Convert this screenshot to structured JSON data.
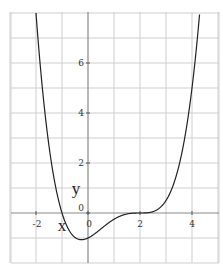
{
  "chart_data": {
    "type": "line",
    "title": "",
    "xlabel": "x",
    "ylabel": "y",
    "function": "y = (x + 1)(x - 2)^3 / 8",
    "xlim": [
      -3,
      5.2
    ],
    "ylim": [
      -2,
      8
    ],
    "grid": true,
    "x_ticks": [
      -2,
      0,
      2,
      4
    ],
    "x_tick_labels": [
      "-2",
      "0",
      "2",
      "4"
    ],
    "y_ticks": [
      0,
      2,
      4,
      6
    ],
    "y_tick_labels": [
      "0",
      "2",
      "4",
      "6"
    ],
    "series": [
      {
        "name": "curve",
        "x": [
          -2,
          -1.75,
          -1.5,
          -1.25,
          -1,
          -0.75,
          -0.5,
          -0.25,
          0,
          0.5,
          1,
          1.5,
          2,
          2.5,
          3,
          3.5,
          4,
          4.3
        ],
        "y": [
          8.0,
          4.94,
          2.68,
          1.14,
          0.0,
          -0.64,
          -0.98,
          -1.07,
          -1.0,
          -0.63,
          -0.25,
          -0.04,
          0.0,
          0.05,
          0.5,
          1.9,
          5.0,
          8.0
        ]
      }
    ],
    "key_points": {
      "x_intercepts": [
        -1,
        2
      ],
      "minimum": {
        "x": -0.25,
        "y": -1.07
      },
      "y_intercept": -1,
      "stationary_inflection": {
        "x": 2,
        "y": 0
      }
    },
    "colors": {
      "grid": "#cfcfcf",
      "axis": "#8a8a8a",
      "curve": "#222222"
    }
  },
  "labels": {
    "x_axis_name": "x",
    "y_axis_name": "y",
    "origin_y_label": "0",
    "origin_x_label": "0"
  }
}
